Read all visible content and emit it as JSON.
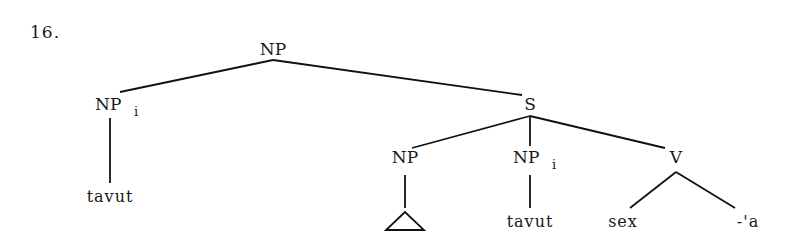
{
  "example_number": "16.",
  "colors": {
    "ink": "#111111",
    "background": "#ffffff"
  },
  "tree": {
    "root": {
      "label": "NP"
    },
    "np_i_left": {
      "label": "NP",
      "subscript": "i",
      "leaf": "tavut"
    },
    "s": {
      "label": "S"
    },
    "np_empty": {
      "label": "NP",
      "leaf_icon": "triangle-icon"
    },
    "np_i_right": {
      "label": "NP",
      "subscript": "i",
      "leaf": "tavut"
    },
    "v": {
      "label": "V",
      "leaves": [
        "sex",
        "-'a"
      ]
    }
  }
}
